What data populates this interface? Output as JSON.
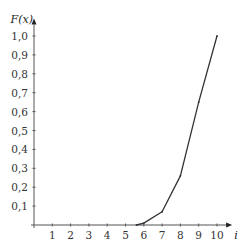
{
  "chart_data": {
    "type": "line",
    "title": "",
    "xlabel": "i",
    "ylabel": "F(x)",
    "x_ticks": [
      "1",
      "2",
      "3",
      "4",
      "5",
      "6",
      "7",
      "8",
      "9",
      "10"
    ],
    "y_ticks": [
      "0,1",
      "0,2",
      "0,3",
      "0,4",
      "0,5",
      "0,6",
      "0,7",
      "0,8",
      "0,9",
      "1,0"
    ],
    "xlim": [
      0,
      10.5
    ],
    "ylim": [
      0,
      1.05
    ],
    "grid": false,
    "legend": null,
    "series": [
      {
        "name": "F(x)",
        "x": [
          5.6,
          6,
          7,
          8,
          9,
          10
        ],
        "y": [
          0.0,
          0.01,
          0.07,
          0.26,
          0.65,
          1.0
        ]
      }
    ]
  },
  "layout": {
    "origin_x": 34,
    "origin_y": 225,
    "px_per_x": 18.3,
    "px_per_y": 189,
    "line_color": "#333333",
    "axis_color": "#555555"
  }
}
